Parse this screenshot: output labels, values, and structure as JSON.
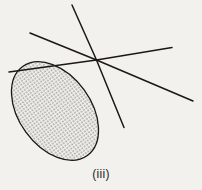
{
  "figure": {
    "caption": "(iii)",
    "background_color": "#f2f1ed",
    "ink_color": "#1b1815",
    "region": {
      "name": "stippled-oval-region",
      "fill_pattern": "dot-stipple",
      "fill_color": "#3a3733",
      "stroke_color": "#1b1815",
      "stroke_width": 1.3,
      "center_x": 55,
      "center_y": 111,
      "radius_x": 36,
      "radius_y": 55,
      "rotation_deg": -36
    },
    "vertex": {
      "name": "common-point",
      "x": 96.5,
      "y": 60.0
    },
    "lines": [
      {
        "name": "line-up-right-steep",
        "x1": 72.0,
        "y1": 5.0,
        "x2": 96.5,
        "y2": 60.0
      },
      {
        "name": "line-upper-left",
        "x1": 30.0,
        "y1": 33.0,
        "x2": 96.5,
        "y2": 60.0
      },
      {
        "name": "line-left-shallow",
        "x1": 9.0,
        "y1": 72.0,
        "x2": 96.5,
        "y2": 60.0
      },
      {
        "name": "line-upper-right",
        "x1": 96.5,
        "y1": 60.0,
        "x2": 172.0,
        "y2": 47.5
      },
      {
        "name": "line-lower-right-shallow",
        "x1": 96.5,
        "y1": 60.0,
        "x2": 193.0,
        "y2": 101.0
      },
      {
        "name": "line-lower-right-steep",
        "x1": 96.5,
        "y1": 60.0,
        "x2": 124.0,
        "y2": 127.5
      }
    ]
  }
}
